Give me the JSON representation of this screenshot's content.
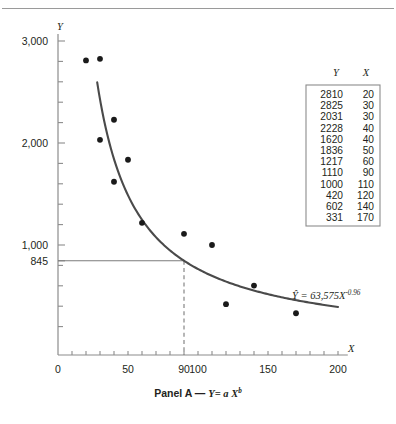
{
  "figure": {
    "caption_prefix": "Panel A",
    "caption_dash": "—",
    "caption_model_y": "Y",
    "caption_model_eq": "= a X",
    "caption_model_exp": "b",
    "top_rule": true
  },
  "axes": {
    "y_name": "Y",
    "x_name": "X",
    "x_tick_labels": [
      "0",
      "50",
      "90",
      "100",
      "150",
      "200"
    ],
    "x_tick_values": [
      0,
      50,
      90,
      100,
      150,
      200
    ],
    "y_tick_labels": [
      "3,000",
      "2,000",
      "1,000",
      "845"
    ],
    "y_tick_values": [
      3000,
      2000,
      1000,
      845
    ],
    "x_minor_step": 10,
    "y_minor_step": 200,
    "xlim": [
      0,
      210
    ],
    "ylim": [
      0,
      3200
    ]
  },
  "annotation": {
    "equation_yhat": "Ŷ",
    "equation_body": "= 63,575X",
    "equation_exponent": "-0.96",
    "reference_y": 845,
    "reference_x": 90
  },
  "table": {
    "headers": [
      "Y",
      "X"
    ],
    "rows": [
      [
        "2810",
        "20"
      ],
      [
        "2825",
        "30"
      ],
      [
        "2031",
        "30"
      ],
      [
        "2228",
        "40"
      ],
      [
        "1620",
        "40"
      ],
      [
        "1836",
        "50"
      ],
      [
        "1217",
        "60"
      ],
      [
        "1110",
        "90"
      ],
      [
        "1000",
        "110"
      ],
      [
        "420",
        "120"
      ],
      [
        "602",
        "140"
      ],
      [
        "331",
        "170"
      ]
    ]
  },
  "colors": {
    "point": "#1a1a1a",
    "curve": "#4a4a4a",
    "axis": "#8c8c8c",
    "reference": "#7b7b7b",
    "text": "#231f20"
  },
  "chart_data": {
    "type": "scatter",
    "xlabel": "X",
    "ylabel": "Y",
    "xlim": [
      0,
      210
    ],
    "ylim": [
      0,
      3200
    ],
    "grid": false,
    "legend": "none",
    "x": [
      20,
      30,
      30,
      40,
      40,
      50,
      60,
      90,
      110,
      120,
      140,
      170
    ],
    "y": [
      2810,
      2825,
      2031,
      2228,
      1620,
      1836,
      1217,
      1110,
      1000,
      420,
      602,
      331
    ],
    "points": [
      {
        "x": 20,
        "y": 2810
      },
      {
        "x": 30,
        "y": 2825
      },
      {
        "x": 30,
        "y": 2031
      },
      {
        "x": 40,
        "y": 2228
      },
      {
        "x": 40,
        "y": 1620
      },
      {
        "x": 50,
        "y": 1836
      },
      {
        "x": 60,
        "y": 1217
      },
      {
        "x": 90,
        "y": 1110
      },
      {
        "x": 110,
        "y": 1000
      },
      {
        "x": 120,
        "y": 420
      },
      {
        "x": 140,
        "y": 602
      },
      {
        "x": 170,
        "y": 331
      }
    ],
    "fit": {
      "kind": "power",
      "label": "Ŷ = 63,575X^-0.96",
      "a": 63575,
      "b": -0.96,
      "x_start": 28,
      "x_end": 200
    },
    "annotations": [
      {
        "type": "hline",
        "y": 845,
        "label": "845"
      },
      {
        "type": "vline",
        "x": 90,
        "label": "90",
        "style": "dashed"
      }
    ],
    "axis_ticks": {
      "x_major": [
        0,
        50,
        90,
        100,
        150,
        200
      ],
      "y_major": [
        1000,
        2000,
        3000
      ],
      "y_special": [
        845
      ]
    }
  }
}
